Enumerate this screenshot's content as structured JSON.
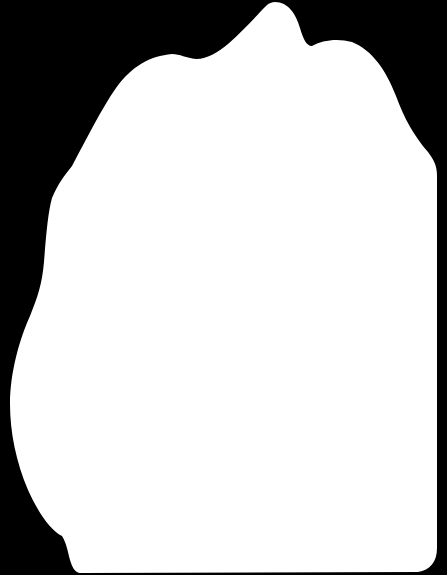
{
  "image": {
    "kind": "silhouette-mask",
    "width": 447,
    "height": 575,
    "background_color": "#000000",
    "shape_color": "#ffffff"
  }
}
